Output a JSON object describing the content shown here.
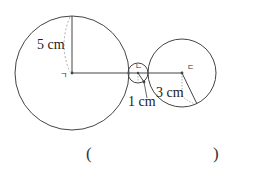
{
  "diagram": {
    "circles": [
      {
        "id": "big",
        "center_label": "ㄱ",
        "radius_label": "5 cm",
        "cx": 72,
        "cy": 73,
        "r": 57
      },
      {
        "id": "small",
        "center_label": "ㄴ",
        "radius_label": "1 cm",
        "cx": 138,
        "cy": 73,
        "r": 10
      },
      {
        "id": "medium",
        "center_label": "ㄷ",
        "radius_label": "3 cm",
        "cx": 182,
        "cy": 73,
        "r": 34
      }
    ],
    "labels": {
      "big_radius": "5 cm",
      "small_radius": "1 cm",
      "medium_radius": "3 cm",
      "big_center": "ㄱ",
      "small_center": "ㄴ",
      "medium_center": "ㄷ"
    },
    "colors": {
      "stroke": "#444444",
      "dashed": "#999999"
    }
  },
  "answer": {
    "open_paren": "(",
    "close_paren": ")",
    "value": ""
  }
}
